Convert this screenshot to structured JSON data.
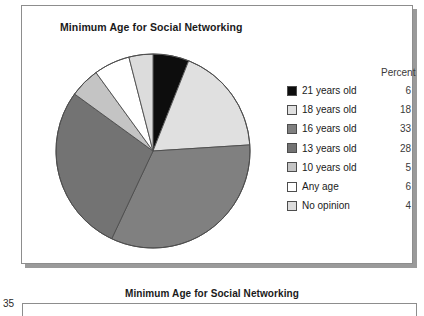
{
  "figure": {
    "title": "Minimum Age for Social Networking",
    "legend_header": "Percent"
  },
  "bottom": {
    "title": "Minimum Age for Social Networking",
    "axis_tick": "35"
  },
  "chart_data": {
    "type": "pie",
    "title": "Minimum Age for Social Networking",
    "xlabel": "",
    "ylabel": "",
    "value_header": "Percent",
    "legend_position": "right",
    "grid": false,
    "start_angle_deg": 0,
    "direction": "clockwise",
    "categories": [
      "21 years old",
      "18 years old",
      "16 years old",
      "13 years old",
      "10 years old",
      "Any age",
      "No opinion"
    ],
    "values": [
      6,
      18,
      33,
      28,
      5,
      6,
      4
    ],
    "colors": [
      "#0d0d0d",
      "#e0e0e0",
      "#808080",
      "#737373",
      "#c4c4c4",
      "#ffffff",
      "#dcdcdc"
    ],
    "slices": [
      {
        "label": "21 years old",
        "value": 6,
        "color": "#0d0d0d"
      },
      {
        "label": "18 years old",
        "value": 18,
        "color": "#e0e0e0"
      },
      {
        "label": "16 years old",
        "value": 33,
        "color": "#808080"
      },
      {
        "label": "13 years old",
        "value": 28,
        "color": "#737373"
      },
      {
        "label": "10 years old",
        "value": 5,
        "color": "#c4c4c4"
      },
      {
        "label": "Any age",
        "value": 6,
        "color": "#ffffff"
      },
      {
        "label": "No opinion",
        "value": 4,
        "color": "#dcdcdc"
      }
    ]
  }
}
